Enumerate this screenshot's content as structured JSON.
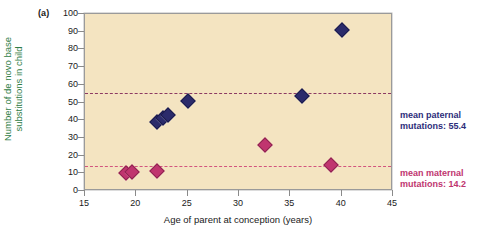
{
  "panel": {
    "label": "(a)"
  },
  "chart_data": {
    "type": "scatter",
    "title": "",
    "xlabel": "Age of parent at conception (years)",
    "ylabel": "Number of de novo base substitutions in child",
    "ylabel_lines": [
      "Number of de novo base",
      "substitutions in child"
    ],
    "xlim": [
      15,
      45
    ],
    "ylim": [
      0,
      100
    ],
    "xticks": [
      15,
      20,
      25,
      30,
      35,
      40,
      45
    ],
    "yticks": [
      0,
      10,
      20,
      30,
      40,
      50,
      60,
      70,
      80,
      90,
      100
    ],
    "grid": false,
    "legend_position": "right",
    "background_color": "#f4e4c1",
    "series": [
      {
        "name": "paternal",
        "color": "#2b2b6b",
        "marker": "diamond",
        "points": [
          {
            "x": 22.0,
            "y": 39
          },
          {
            "x": 22.6,
            "y": 41
          },
          {
            "x": 23.1,
            "y": 43
          },
          {
            "x": 25.0,
            "y": 51
          },
          {
            "x": 36.1,
            "y": 53.5
          },
          {
            "x": 40.0,
            "y": 91
          }
        ]
      },
      {
        "name": "maternal",
        "color": "#c0356f",
        "marker": "diamond",
        "points": [
          {
            "x": 19.0,
            "y": 10
          },
          {
            "x": 19.6,
            "y": 11
          },
          {
            "x": 22.0,
            "y": 11.5
          },
          {
            "x": 32.5,
            "y": 26
          },
          {
            "x": 39.0,
            "y": 14.5
          }
        ]
      }
    ],
    "reference_lines": [
      {
        "name": "mean-paternal",
        "value": 55.4,
        "color": "#8c3a63",
        "style": "dashed",
        "label_lines": [
          "mean paternal",
          "mutations: 55.4"
        ]
      },
      {
        "name": "mean-maternal",
        "value": 14.2,
        "color": "#d2547e",
        "style": "dashed",
        "label_lines": [
          "mean maternal",
          "mutations: 14.2"
        ]
      }
    ]
  }
}
